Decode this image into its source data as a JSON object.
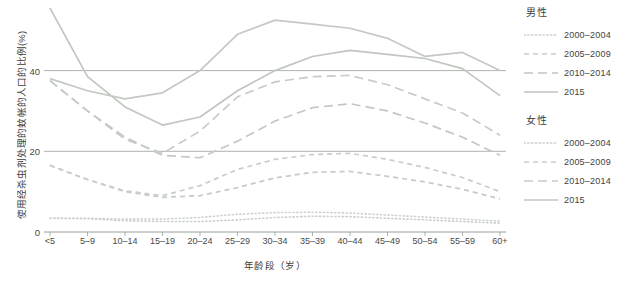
{
  "chart_data": {
    "type": "line",
    "title": "",
    "xlabel": "年龄段（岁）",
    "ylabel": "使用经杀虫剂处理的蚊帐的人口的比例(%)",
    "categories": [
      "<5",
      "5-9",
      "10-14",
      "15-19",
      "20-24",
      "25-29",
      "30-34",
      "35-39",
      "40-44",
      "45-49",
      "50-54",
      "55-59",
      "60+"
    ],
    "ylim": [
      0,
      57
    ],
    "yticks": [
      0,
      20,
      40
    ],
    "ytick_labels": [
      "0",
      "20",
      "40"
    ],
    "grid": "horizontal",
    "legend_position": "right",
    "series": [
      {
        "name": "男性 2000-2004",
        "group": "男性",
        "period": "2000-2004",
        "style": "dotted",
        "color": "#c9cfc9",
        "values": [
          3.4,
          3.3,
          2.8,
          2.6,
          2.6,
          3.0,
          3.6,
          3.9,
          3.8,
          3.4,
          3.0,
          2.6,
          2.2
        ]
      },
      {
        "name": "男性 2005-2009",
        "group": "男性",
        "period": "2005-2009",
        "style": "dashed-short",
        "color": "#c5cbc5",
        "values": [
          16.5,
          13.0,
          10.0,
          8.6,
          9.0,
          11.0,
          13.4,
          14.8,
          15.0,
          13.8,
          12.4,
          10.6,
          8.2
        ]
      },
      {
        "name": "男性 2010-2014",
        "group": "男性",
        "period": "2010-2014",
        "style": "dashed-long",
        "color": "#c2c8c2",
        "values": [
          37.5,
          30.0,
          23.5,
          19.0,
          18.4,
          22.5,
          27.5,
          30.8,
          31.8,
          30.0,
          27.0,
          23.5,
          19.0
        ]
      },
      {
        "name": "男性 2015",
        "group": "男性",
        "period": "2015",
        "style": "solid",
        "color": "#c0c6c0",
        "values": [
          55.5,
          38.5,
          31.0,
          26.5,
          28.5,
          35.0,
          40.0,
          43.5,
          45.0,
          44.0,
          43.0,
          40.5,
          33.8
        ]
      },
      {
        "name": "女性 2000-2004",
        "group": "女性",
        "period": "2000-2004",
        "style": "dotted",
        "color": "#cdd3cd",
        "values": [
          3.4,
          3.4,
          3.2,
          3.2,
          3.6,
          4.4,
          4.8,
          4.9,
          4.7,
          4.2,
          3.7,
          3.2,
          2.7
        ]
      },
      {
        "name": "女性 2005-2009",
        "group": "女性",
        "period": "2005-2009",
        "style": "dashed-short",
        "color": "#c8cec8",
        "values": [
          16.5,
          13.0,
          10.2,
          9.0,
          11.5,
          15.5,
          18.0,
          19.2,
          19.5,
          18.0,
          16.0,
          13.5,
          10.0
        ]
      },
      {
        "name": "女性 2010-2014",
        "group": "女性",
        "period": "2010-2014",
        "style": "dashed-long",
        "color": "#c6ccc6",
        "values": [
          37.5,
          30.0,
          23.0,
          19.5,
          25.0,
          33.5,
          37.2,
          38.5,
          38.8,
          36.5,
          33.0,
          29.5,
          24.0
        ]
      },
      {
        "name": "女性 2015",
        "group": "女性",
        "period": "2015",
        "style": "solid",
        "color": "#c3c9c3",
        "values": [
          38.0,
          35.0,
          33.0,
          34.5,
          40.0,
          49.0,
          52.5,
          51.5,
          50.5,
          48.0,
          43.5,
          44.5,
          40.0
        ]
      }
    ]
  },
  "legend": {
    "groups": [
      {
        "title": "男性",
        "entries": [
          {
            "label": "2000-2004",
            "style": "dotted"
          },
          {
            "label": "2005-2009",
            "style": "dashed-short"
          },
          {
            "label": "2010-2014",
            "style": "dashed-long"
          },
          {
            "label": "2015",
            "style": "solid"
          }
        ]
      },
      {
        "title": "女性",
        "entries": [
          {
            "label": "2000-2004",
            "style": "dotted"
          },
          {
            "label": "2005-2009",
            "style": "dashed-short"
          },
          {
            "label": "2010-2014",
            "style": "dashed-long"
          },
          {
            "label": "2015",
            "style": "solid"
          }
        ]
      }
    ]
  },
  "colors": {
    "line": "#c4cac4",
    "grid": "#8d948d",
    "axis": "#8d948d",
    "text": "#3d3d3d"
  }
}
